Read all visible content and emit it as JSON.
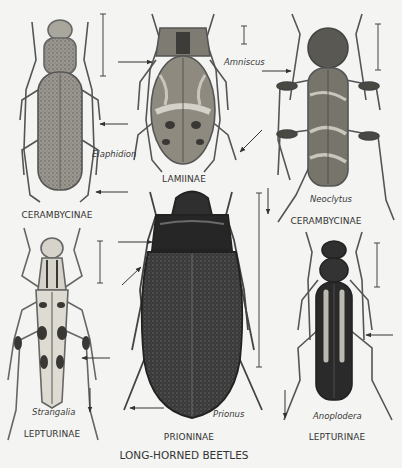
{
  "plate": {
    "title": "LONG-HORNED BEETLES",
    "background": "#f4f4f2",
    "ink": "#2a2a2a"
  },
  "specimens": [
    {
      "id": "elaphidion",
      "genus": "Elaphidion",
      "subfamily": "CERAMBYCINAE",
      "tone": "light-speckled",
      "position": "top-left"
    },
    {
      "id": "amniscus",
      "genus": "Amniscus",
      "subfamily": "LAMIINAE",
      "tone": "mottled",
      "position": "top-center"
    },
    {
      "id": "neoclytus",
      "genus": "Neoclytus",
      "subfamily": "CERAMBYCINAE",
      "tone": "banded",
      "position": "top-right"
    },
    {
      "id": "strangalia",
      "genus": "Strangalia",
      "subfamily": "LEPTURINAE",
      "tone": "pale-spotted",
      "position": "bottom-left"
    },
    {
      "id": "prionus",
      "genus": "Prionus",
      "subfamily": "PRIONINAE",
      "tone": "dark",
      "position": "bottom-center"
    },
    {
      "id": "anoplodera",
      "genus": "Anoplodera",
      "subfamily": "LEPTURINAE",
      "tone": "dark-striped",
      "position": "bottom-right"
    }
  ],
  "annotations": {
    "scale_bars": "vertical lines indicating natural size",
    "pointer_arrows": "arrows marking diagnostic features"
  }
}
